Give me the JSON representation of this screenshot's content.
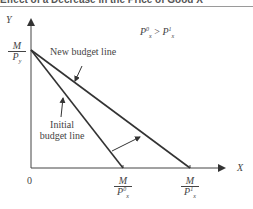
{
  "header": {
    "title": "Effect of a Decrease in the Price of Good X"
  },
  "diagram": {
    "axes": {
      "y_label": "Y",
      "x_label": "X",
      "origin_label": "0"
    },
    "y_intercept": {
      "num": "M",
      "den_base": "P",
      "den_sub": "y"
    },
    "x_intercept_initial": {
      "num": "M",
      "den_base": "P",
      "den_sup": "0",
      "den_sub": "x"
    },
    "x_intercept_new": {
      "num": "M",
      "den_base": "P",
      "den_sup": "1",
      "den_sub": "x"
    },
    "condition": {
      "left_base": "P",
      "left_sup": "0",
      "left_sub": "x",
      "op": ">",
      "right_base": "P",
      "right_sup": "1",
      "right_sub": "x"
    },
    "annotations": {
      "new_budget_line": "New budget line",
      "initial_line_1": "Initial",
      "initial_line_2": "budget line"
    },
    "colors": {
      "line": "#333333",
      "axis": "#444444"
    }
  }
}
